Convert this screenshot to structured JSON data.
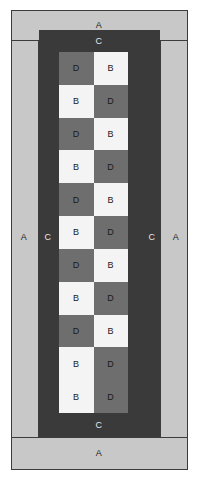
{
  "figure": {
    "width": 200,
    "height": 483
  },
  "colors": {
    "region_a_fill": "#c8c8c8",
    "region_c_fill": "#3a3a3a",
    "cell_d_fill": "#6e6e6e",
    "cell_b_fill": "#f4f4f4",
    "outline": "#3c3c3c",
    "text_on_light": "#1a1a1a",
    "text_on_dark": "#e8e8e8"
  },
  "labels": {
    "a_top": "A",
    "a_bottom": "A",
    "a_left": "A",
    "a_right": "A",
    "c_top": "C",
    "c_bottom": "C",
    "c_left": "C",
    "c_right": "C"
  },
  "checkerboard": {
    "columns": 2,
    "rows": 11,
    "cells": [
      [
        "D",
        "B"
      ],
      [
        "B",
        "D"
      ],
      [
        "D",
        "B"
      ],
      [
        "B",
        "D"
      ],
      [
        "D",
        "B"
      ],
      [
        "B",
        "D"
      ],
      [
        "D",
        "B"
      ],
      [
        "B",
        "D"
      ],
      [
        "D",
        "B"
      ],
      [
        "B",
        "D"
      ],
      [
        "B",
        "D"
      ]
    ]
  }
}
